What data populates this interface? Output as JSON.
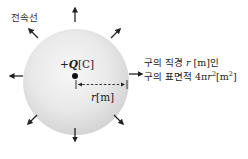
{
  "diagram": {
    "type": "electric flux from a point charge inside a sphere",
    "flux_label": "전속선",
    "charge": {
      "sign": "+",
      "symbol": "Q",
      "unit": "[C]"
    },
    "radius": {
      "symbol": "r",
      "unit": "[m]"
    },
    "description": {
      "line1_prefix": "구의 직경 ",
      "line1_symbol": "r",
      "line1_suffix": " [m]인",
      "line2_prefix": "구의 표면적 ",
      "line2_coef": "4π",
      "line2_symbol": "r",
      "line2_exp": "2",
      "line2_unit_open": "[m",
      "line2_unit_exp": "2",
      "line2_unit_close": "]"
    },
    "arrows": [
      "up",
      "up-right",
      "right",
      "down-right",
      "down",
      "down-left",
      "left",
      "up-left"
    ],
    "colors": {
      "sphere_center": "#f4f4f4",
      "sphere_edge": "#d6d6d6",
      "ink": "#222222"
    }
  }
}
